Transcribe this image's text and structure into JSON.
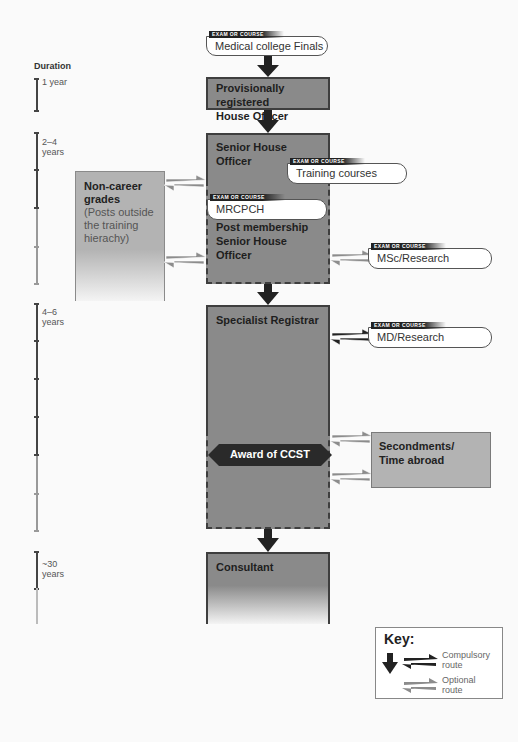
{
  "duration": {
    "title": "Duration",
    "periods": [
      {
        "label": "1 year"
      },
      {
        "label_line1": "2–4",
        "label_line2": "years"
      },
      {
        "label_line1": "4–6",
        "label_line2": "years"
      },
      {
        "label_line1": "~30",
        "label_line2": "years"
      }
    ]
  },
  "exam_tag": "EXAM OR COURSE",
  "exams": {
    "finals": "Medical college Finals",
    "training": "Training courses",
    "mrcpch": "MRCPCH",
    "msc": "MSc/Research",
    "md": "MD/Research"
  },
  "stages": {
    "prho_line1": "Provisionally registered",
    "prho_line2": "House Officer",
    "sho": "Senior House Officer",
    "pmsho_line1": "Post membership",
    "pmsho_line2": "Senior House Officer",
    "spr": "Specialist Registrar",
    "ccst": "Award of CCST",
    "consultant": "Consultant"
  },
  "side_boxes": {
    "non_career_title_line1": "Non-career",
    "non_career_title_line2": "grades",
    "non_career_desc_line1": "(Posts outside",
    "non_career_desc_line2": "the training",
    "non_career_desc_line3": "hierachy)",
    "secondments_line1": "Secondments/",
    "secondments_line2": "Time abroad"
  },
  "key": {
    "title": "Key:",
    "compulsory_line1": "Compulsory",
    "compulsory_line2": "route",
    "optional_line1": "Optional",
    "optional_line2": "route"
  },
  "colors": {
    "stage_fill": "#8a8a8a",
    "side_fill": "#b3b3b3",
    "compulsory_arrow": "#222222",
    "optional_arrow": "#8c8c8c"
  }
}
